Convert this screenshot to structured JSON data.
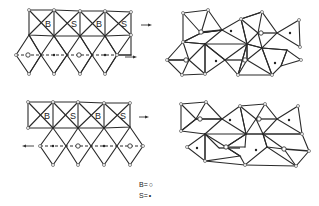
{
  "figure": {
    "panels": [
      {
        "id": "top-left",
        "description": "ordered layer: row of square units labelled B,S,B,S above a row of diamond units; arrows point right",
        "square_labels": [
          "B",
          "S",
          "B",
          "S"
        ],
        "row_arrows": [
          "right",
          "right"
        ]
      },
      {
        "id": "top-right",
        "description": "distorted layer of triangular units after shear, B (open circle) and S (dot) sites"
      },
      {
        "id": "bottom-left",
        "description": "ordered layer: row of square units labelled B,S,B,S above a row of diamond units; top arrow right, bottom arrow left",
        "square_labels": [
          "B",
          "S",
          "B",
          "S"
        ],
        "row_arrows": [
          "right",
          "left"
        ]
      },
      {
        "id": "bottom-right",
        "description": "distorted layer of triangular units after opposite shear, B (open circle) and S (dot) sites"
      }
    ],
    "legend": [
      {
        "symbol": "B",
        "equals": "=",
        "glyph": "○"
      },
      {
        "symbol": "S",
        "equals": "=",
        "glyph": "•"
      }
    ]
  }
}
